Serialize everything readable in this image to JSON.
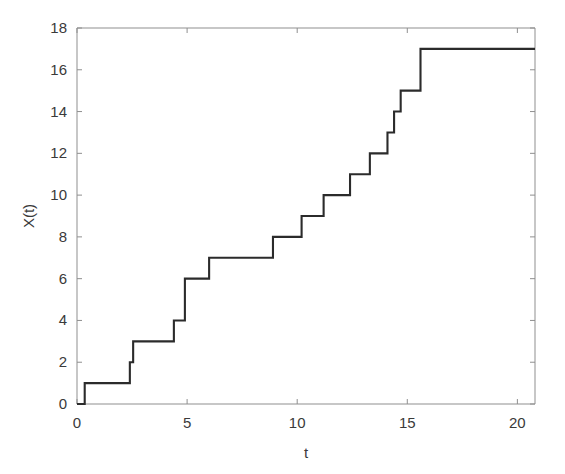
{
  "figure": {
    "background_color": "#ffffff",
    "axes_color": "#8f8f8f",
    "line_color": "#2b2b2b",
    "text_color": "#3a3a3a"
  },
  "chart_data": {
    "type": "line",
    "subtype": "step-post",
    "title": "",
    "subtitle": "",
    "xlabel": "t",
    "ylabel": "X(t)",
    "xlim": [
      0,
      20.8
    ],
    "ylim": [
      0,
      18
    ],
    "xticks": [
      0,
      5,
      10,
      15,
      20
    ],
    "xtick_labels": [
      "0",
      "5",
      "10",
      "15",
      "20"
    ],
    "yticks": [
      0,
      2,
      4,
      6,
      8,
      10,
      12,
      14,
      16,
      18
    ],
    "ytick_labels": [
      "0",
      "2",
      "4",
      "6",
      "8",
      "10",
      "12",
      "14",
      "16",
      "18"
    ],
    "grid": false,
    "legend": null,
    "legend_position": "none",
    "annotations": [],
    "series": [
      {
        "name": "X(t)",
        "color": "#2b2b2b",
        "jump_times": [
          0.35,
          2.4,
          2.55,
          4.4,
          4.9,
          6.0,
          8.9,
          10.2,
          11.2,
          12.4,
          13.3,
          14.1,
          14.4,
          14.7,
          15.6
        ],
        "jump_values": [
          1,
          2,
          3,
          4,
          6,
          7,
          8,
          9,
          10,
          11,
          12,
          13,
          14,
          15,
          17
        ],
        "x": [
          0,
          0.35,
          0.35,
          2.4,
          2.4,
          2.55,
          2.55,
          4.4,
          4.4,
          4.9,
          4.9,
          6.0,
          6.0,
          8.9,
          8.9,
          10.2,
          10.2,
          11.2,
          11.2,
          12.4,
          12.4,
          13.3,
          13.3,
          14.1,
          14.1,
          14.4,
          14.4,
          14.7,
          14.7,
          15.6,
          15.6,
          20.8
        ],
        "y": [
          0,
          0,
          1,
          1,
          2,
          2,
          3,
          3,
          4,
          4,
          6,
          6,
          7,
          7,
          8,
          8,
          9,
          9,
          10,
          10,
          11,
          11,
          12,
          12,
          13,
          13,
          14,
          14,
          15,
          15,
          17,
          17
        ],
        "start_value": 0,
        "end_value": 17
      }
    ]
  }
}
